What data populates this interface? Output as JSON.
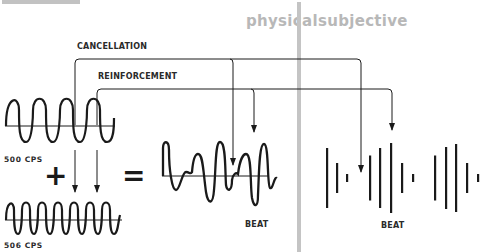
{
  "top_fragment": "cannot be heard.",
  "sections": {
    "physical": "physical",
    "subjective": "subjective"
  },
  "labels": {
    "cancellation": "CANCELLATION",
    "reinforcement": "REINFORCEMENT",
    "wave1_freq": "500  CPS",
    "wave2_freq": "506  CPS",
    "plus": "+",
    "equals": "=",
    "beat_physical": "BEAT",
    "beat_subjective": "BEAT"
  },
  "colors": {
    "ink": "#1a1a1a",
    "section_title": "#b8b8b8",
    "divider": "#c4c4c4"
  },
  "subjective_bars": [
    {
      "x": 327,
      "h": 60
    },
    {
      "x": 337,
      "h": 30
    },
    {
      "x": 347,
      "h": 8
    },
    {
      "x": 370,
      "h": 45
    },
    {
      "x": 380,
      "h": 60
    },
    {
      "x": 391,
      "h": 70
    },
    {
      "x": 402,
      "h": 30
    },
    {
      "x": 413,
      "h": 8
    },
    {
      "x": 435,
      "h": 45
    },
    {
      "x": 446,
      "h": 62
    },
    {
      "x": 456,
      "h": 68
    },
    {
      "x": 467,
      "h": 30
    },
    {
      "x": 478,
      "h": 8
    }
  ]
}
